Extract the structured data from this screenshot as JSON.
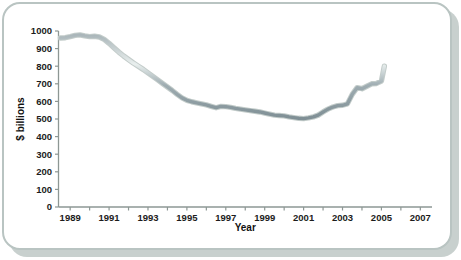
{
  "figure": {
    "background_color": "#ffffff",
    "panel_border_color": "#b9c4c2",
    "panel_shadow_color": "#c8d0ce",
    "card_color": "#ffffff",
    "axis_color": "#8d9794",
    "line_color": "#8d9ba0",
    "line_highlight_color": "#e6eceb"
  },
  "chart_data": {
    "type": "line",
    "title": "",
    "subtitle": "",
    "xlabel": "Year",
    "ylabel": "$ billions",
    "xlim": [
      1988.4,
      2007.6
    ],
    "ylim": [
      0,
      1000
    ],
    "grid": false,
    "legend": null,
    "xticks": [
      1989,
      1990,
      1991,
      1992,
      1993,
      1994,
      1995,
      1996,
      1997,
      1998,
      1999,
      2000,
      2001,
      2002,
      2003,
      2004,
      2005,
      2006,
      2007
    ],
    "xtick_labels": [
      "1989",
      "",
      "1991",
      "",
      "1993",
      "",
      "1995",
      "",
      "1997",
      "",
      "1999",
      "",
      "2001",
      "",
      "2003",
      "",
      "2005",
      "",
      "2007"
    ],
    "yticks": [
      0,
      100,
      200,
      300,
      400,
      500,
      600,
      700,
      800,
      900,
      1000
    ],
    "ytick_labels": [
      "0",
      "100",
      "200",
      "300",
      "400",
      "500",
      "600",
      "700",
      "800",
      "900",
      "1000"
    ],
    "series": [
      {
        "name": "value",
        "x": [
          1988.5,
          1988.75,
          1989.0,
          1989.25,
          1989.5,
          1989.75,
          1990.0,
          1990.25,
          1990.5,
          1990.75,
          1991.0,
          1991.25,
          1991.5,
          1991.75,
          1992.0,
          1992.25,
          1992.5,
          1992.75,
          1993.0,
          1993.25,
          1993.5,
          1993.75,
          1994.0,
          1994.25,
          1994.5,
          1994.75,
          1995.0,
          1995.25,
          1995.5,
          1995.75,
          1996.0,
          1996.25,
          1996.5,
          1996.75,
          1997.0,
          1997.25,
          1997.5,
          1997.75,
          1998.0,
          1998.25,
          1998.5,
          1998.75,
          1999.0,
          1999.25,
          1999.5,
          1999.75,
          2000.0,
          2000.25,
          2000.5,
          2000.75,
          2001.0,
          2001.25,
          2001.5,
          2001.75,
          2002.0,
          2002.25,
          2002.5,
          2002.75,
          2003.0,
          2003.25,
          2003.5,
          2003.75,
          2004.0,
          2004.25,
          2004.5,
          2004.75,
          2005.0,
          2005.15
        ],
        "values": [
          960,
          962,
          968,
          975,
          978,
          972,
          968,
          970,
          966,
          952,
          930,
          905,
          880,
          858,
          838,
          818,
          800,
          782,
          762,
          742,
          722,
          702,
          682,
          662,
          640,
          620,
          606,
          598,
          592,
          586,
          580,
          572,
          564,
          572,
          570,
          566,
          560,
          556,
          552,
          548,
          544,
          540,
          534,
          528,
          522,
          520,
          518,
          512,
          508,
          504,
          502,
          506,
          512,
          522,
          540,
          556,
          568,
          576,
          578,
          586,
          640,
          678,
          672,
          686,
          700,
          702,
          716,
          800
        ]
      }
    ]
  }
}
